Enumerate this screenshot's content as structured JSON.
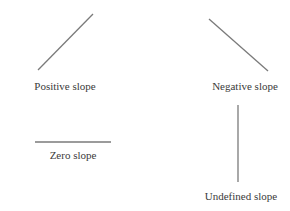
{
  "diagram": {
    "line_color": "#7a7a7a",
    "text_color": "#3a3a3a",
    "items": [
      {
        "id": "positive",
        "label": "Positive slope",
        "line": {
          "x1": 38,
          "y1": 70,
          "x2": 93,
          "y2": 14
        },
        "label_pos": {
          "x": 65,
          "y": 80
        }
      },
      {
        "id": "negative",
        "label": "Negative slope",
        "line": {
          "x1": 209,
          "y1": 19,
          "x2": 268,
          "y2": 71
        },
        "label_pos": {
          "x": 245,
          "y": 80
        }
      },
      {
        "id": "zero",
        "label": "Zero slope",
        "line": {
          "x1": 35,
          "y1": 142,
          "x2": 111,
          "y2": 142
        },
        "label_pos": {
          "x": 73,
          "y": 149
        }
      },
      {
        "id": "undefined",
        "label": "Undefined slope",
        "line": {
          "x1": 238,
          "y1": 105,
          "x2": 238,
          "y2": 182
        },
        "label_pos": {
          "x": 241,
          "y": 190
        }
      }
    ]
  }
}
